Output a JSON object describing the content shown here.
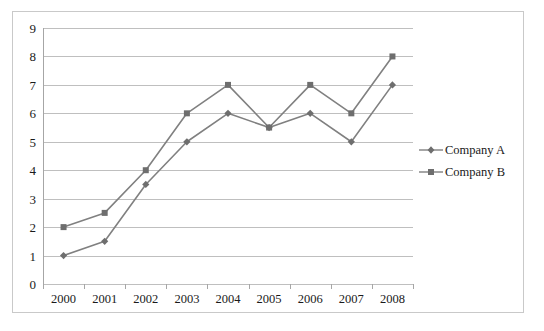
{
  "chart_data": {
    "type": "line",
    "title": "",
    "xlabel": "",
    "ylabel": "",
    "categories": [
      "2000",
      "2001",
      "2002",
      "2003",
      "2004",
      "2005",
      "2006",
      "2007",
      "2008"
    ],
    "series": [
      {
        "name": "Company A",
        "marker": "diamond",
        "color": "#808080",
        "values": [
          1,
          1.5,
          3.5,
          5,
          6,
          5.5,
          6,
          5,
          7
        ]
      },
      {
        "name": "Company B",
        "marker": "square",
        "color": "#808080",
        "values": [
          2,
          2.5,
          4,
          6,
          7,
          5.5,
          7,
          6,
          8
        ]
      }
    ],
    "ylim": [
      0,
      9
    ],
    "yticks": [
      0,
      1,
      2,
      3,
      4,
      5,
      6,
      7,
      8,
      9
    ],
    "ytick_labels": [
      "0",
      "1",
      "2",
      "3",
      "4",
      "5",
      "6",
      "7",
      "8",
      "9"
    ],
    "grid": true,
    "grid_color": "#bfbfbf",
    "legend_position": "right",
    "plot_background": "#ffffff",
    "frame_border_color": "#c9c9c9"
  },
  "legend": {
    "entries": [
      {
        "label": "Company A",
        "marker": "diamond"
      },
      {
        "label": "Company B",
        "marker": "square"
      }
    ]
  }
}
